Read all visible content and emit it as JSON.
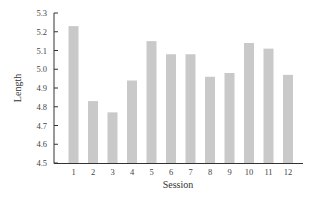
{
  "chart_data": {
    "type": "bar",
    "title": "",
    "xlabel": "Session",
    "ylabel": "Length",
    "categories": [
      "1",
      "2",
      "3",
      "4",
      "5",
      "6",
      "7",
      "8",
      "9",
      "10",
      "11",
      "12"
    ],
    "values": [
      5.23,
      4.83,
      4.77,
      4.94,
      5.15,
      5.08,
      5.08,
      4.96,
      4.98,
      5.14,
      5.11,
      4.97
    ],
    "ylim": [
      4.5,
      5.3
    ],
    "yticks": [
      4.5,
      4.6,
      4.7,
      4.8,
      4.9,
      5.0,
      5.1,
      5.2,
      5.3
    ],
    "ytick_labels": [
      "4.5",
      "4.6",
      "4.7",
      "4.8",
      "4.9",
      "5.0",
      "5.1",
      "5.2",
      "5.3"
    ],
    "grid": false,
    "legend": null,
    "bar_color": "#c9c9c9",
    "axis_color": "#333333"
  }
}
